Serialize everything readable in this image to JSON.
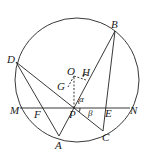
{
  "diagram": {
    "type": "circle-geometry",
    "points": [
      "A",
      "B",
      "C",
      "D",
      "E",
      "F",
      "G",
      "H",
      "M",
      "N",
      "O",
      "P"
    ],
    "angles": [
      "α",
      "β"
    ],
    "segments": [
      "MN",
      "DC",
      "DA",
      "AB",
      "BC",
      "OP",
      "OG",
      "OH"
    ],
    "labels": {
      "A": "A",
      "B": "B",
      "C": "C",
      "D": "D",
      "E": "E",
      "F": "F",
      "G": "G",
      "H": "H",
      "M": "M",
      "N": "N",
      "O": "O",
      "P": "P",
      "alpha": "α",
      "beta": "β"
    }
  }
}
